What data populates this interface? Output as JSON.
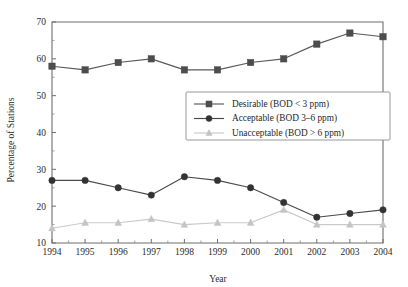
{
  "chart_data": {
    "type": "line",
    "title": "",
    "xlabel": "Year",
    "ylabel": "Percentage of Stations",
    "x": [
      1994,
      1995,
      1996,
      1997,
      1998,
      1999,
      2000,
      2001,
      2002,
      2003,
      2004
    ],
    "categories": [
      "1994",
      "1995",
      "1996",
      "1997",
      "1998",
      "1999",
      "2000",
      "2001",
      "2002",
      "2003",
      "2004"
    ],
    "xlim": [
      1994,
      2004
    ],
    "ylim": [
      10,
      70
    ],
    "y_ticks": [
      10,
      20,
      30,
      40,
      50,
      60,
      70
    ],
    "y_minor_ticks": [
      15,
      25,
      35,
      45,
      55,
      65
    ],
    "grid": false,
    "legend_position": "upper center",
    "series": [
      {
        "name": "Desirable (BOD < 3 ppm)",
        "marker": "square",
        "color": "#4d4d4d",
        "line_color": "#595959",
        "values": [
          58,
          57,
          59,
          60,
          57,
          57,
          59,
          60,
          64,
          67,
          66
        ]
      },
      {
        "name": "Acceptable (BOD 3–6 ppm)",
        "marker": "circle",
        "color": "#333333",
        "line_color": "#4a4a4a",
        "values": [
          27,
          27,
          25,
          23,
          28,
          27,
          25,
          21,
          17,
          18,
          19
        ]
      },
      {
        "name": "Unacceptable (BOD > 6 ppm)",
        "marker": "triangle",
        "color": "#c4c4c4",
        "line_color": "#cacaca",
        "values": [
          14,
          15.5,
          15.5,
          16.5,
          15,
          15.5,
          15.5,
          19,
          15,
          15,
          15
        ]
      }
    ]
  },
  "axes": {
    "x_title": "Year",
    "y_title": "Percentage of Stations"
  },
  "legend": {
    "entries": [
      {
        "label": "Desirable (BOD < 3 ppm)"
      },
      {
        "label": "Acceptable (BOD 3–6 ppm)"
      },
      {
        "label": "Unacceptable (BOD > 6 ppm)"
      }
    ]
  },
  "colors": {
    "desirable": "#4d4d4d",
    "acceptable": "#333333",
    "unacceptable": "#c4c4c4",
    "axis": "#6e6e6e",
    "text": "#1f1f1f",
    "background": "#ffffff"
  }
}
